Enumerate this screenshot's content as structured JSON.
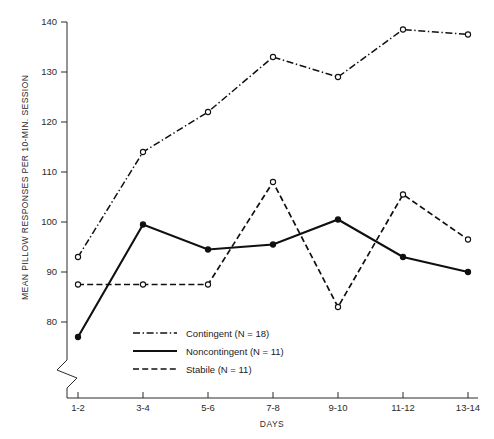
{
  "chart_data": {
    "type": "line",
    "title": "",
    "xlabel": "DAYS",
    "ylabel": "MEAN PILLOW RESPONSES PER 10-MIN. SESSION",
    "categories": [
      "1-2",
      "3-4",
      "5-6",
      "7-8",
      "9-10",
      "11-12",
      "13-14"
    ],
    "ylim": [
      75,
      140
    ],
    "yticks": [
      80,
      90,
      100,
      110,
      120,
      130,
      140
    ],
    "ytick_labels": [
      "80",
      "90",
      "100",
      "110",
      "120",
      "130",
      "140"
    ],
    "axis_break": true,
    "grid": false,
    "legend_position": "lower-center-inside",
    "series": [
      {
        "name": "Contingent (N = 18)",
        "n": 18,
        "line_style": "dash-dot",
        "marker": "open-circle",
        "values": [
          93.0,
          114.0,
          122.0,
          133.0,
          129.0,
          138.5,
          137.5
        ]
      },
      {
        "name": "Noncontingent (N = 11)",
        "n": 11,
        "line_style": "solid",
        "marker": "filled-circle",
        "values": [
          77.0,
          99.5,
          94.5,
          95.5,
          100.5,
          93.0,
          90.0
        ]
      },
      {
        "name": "Stabile (N = 11)",
        "n": 11,
        "line_style": "dashed",
        "marker": "open-circle",
        "values": [
          87.5,
          87.5,
          87.5,
          108.0,
          83.0,
          105.5,
          96.5
        ]
      }
    ]
  },
  "legend": {
    "items": [
      {
        "label": "Contingent (N = 18)",
        "style": "dash-dot"
      },
      {
        "label": "Noncontingent (N = 11)",
        "style": "solid"
      },
      {
        "label": "Stabile (N = 11)",
        "style": "dashed"
      }
    ]
  },
  "colors": {
    "ink": "#101010",
    "axis": "#2b2b2b",
    "background": "#ffffff"
  }
}
